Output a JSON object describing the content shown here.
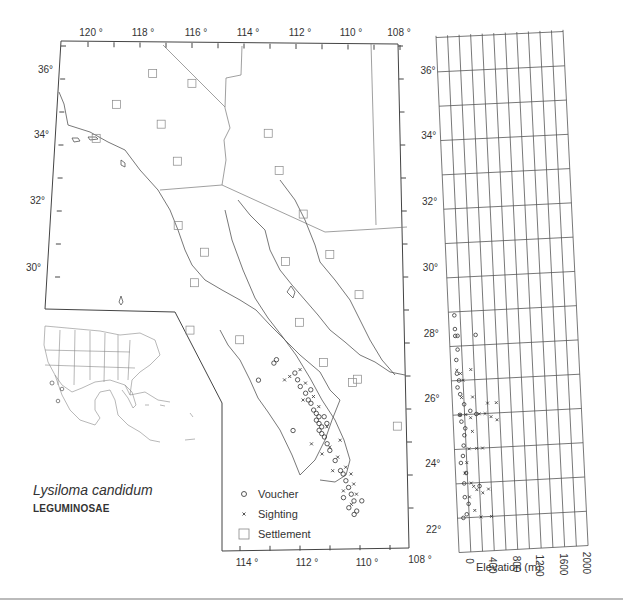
{
  "map": {
    "title_species": "Lysiloma candidum",
    "title_family": "LEGUMINOSAE",
    "top_longitude_labels": [
      "120 °",
      "118 °",
      "116 °",
      "114 °",
      "112 °",
      "110 °",
      "108 °"
    ],
    "bottom_longitude_labels": [
      "114 °",
      "112 °",
      "110 °",
      "108 °"
    ],
    "left_latitude_labels": [
      "36°",
      "34°",
      "32°",
      "30°"
    ],
    "right_latitude_labels": [
      "36°",
      "34°",
      "32°",
      "30°",
      "28°",
      "26°",
      "24°",
      "22°"
    ],
    "legend": [
      {
        "symbol": "circle",
        "label": "Voucher"
      },
      {
        "symbol": "cross",
        "label": "Sighting"
      },
      {
        "symbol": "square",
        "label": "Settlement"
      }
    ],
    "settlements": [
      [
        117.5,
        36.1
      ],
      [
        116.0,
        35.8
      ],
      [
        118.9,
        35.2
      ],
      [
        117.2,
        34.6
      ],
      [
        119.7,
        34.2
      ],
      [
        113.1,
        34.3
      ],
      [
        116.6,
        33.5
      ],
      [
        112.7,
        33.2
      ],
      [
        111.8,
        31.9
      ],
      [
        116.6,
        31.6
      ],
      [
        115.6,
        30.8
      ],
      [
        112.5,
        30.5
      ],
      [
        110.8,
        30.7
      ],
      [
        116.0,
        29.9
      ],
      [
        109.7,
        29.5
      ],
      [
        116.2,
        28.5
      ],
      [
        112.0,
        28.7
      ],
      [
        114.3,
        28.2
      ],
      [
        109.8,
        27.0
      ],
      [
        111.1,
        27.5
      ],
      [
        108.3,
        25.6
      ],
      [
        110.0,
        26.9
      ]
    ],
    "vouchers": [
      [
        112.9,
        27.6
      ],
      [
        113.0,
        27.5
      ],
      [
        112.2,
        27.2
      ],
      [
        112.1,
        27.0
      ],
      [
        112.0,
        26.8
      ],
      [
        111.8,
        26.6
      ],
      [
        111.7,
        26.4
      ],
      [
        111.6,
        26.3
      ],
      [
        111.5,
        26.1
      ],
      [
        111.4,
        26.0
      ],
      [
        111.3,
        25.9
      ],
      [
        111.4,
        25.8
      ],
      [
        111.3,
        25.7
      ],
      [
        111.2,
        25.6
      ],
      [
        111.3,
        25.5
      ],
      [
        111.2,
        25.4
      ],
      [
        111.1,
        25.3
      ],
      [
        111.0,
        25.1
      ],
      [
        110.9,
        24.9
      ],
      [
        110.7,
        24.6
      ],
      [
        110.5,
        24.3
      ],
      [
        110.4,
        24.2
      ],
      [
        110.3,
        24.0
      ],
      [
        110.2,
        23.8
      ],
      [
        110.1,
        23.6
      ],
      [
        110.0,
        23.4
      ],
      [
        110.2,
        23.2
      ],
      [
        109.9,
        23.1
      ],
      [
        110.0,
        23.0
      ],
      [
        109.7,
        23.4
      ],
      [
        110.4,
        23.5
      ],
      [
        111.1,
        25.9
      ],
      [
        111.0,
        25.7
      ],
      [
        112.3,
        25.5
      ],
      [
        111.6,
        26.7
      ],
      [
        113.6,
        27.0
      ]
    ],
    "sightings": [
      [
        112.6,
        27.0
      ],
      [
        112.4,
        27.1
      ],
      [
        112.0,
        27.3
      ],
      [
        111.8,
        26.9
      ],
      [
        111.5,
        26.5
      ],
      [
        111.3,
        26.2
      ],
      [
        111.0,
        25.6
      ],
      [
        110.9,
        25.0
      ],
      [
        110.6,
        24.7
      ],
      [
        110.3,
        24.4
      ],
      [
        110.1,
        24.2
      ],
      [
        110.0,
        23.9
      ],
      [
        109.9,
        23.6
      ],
      [
        110.1,
        23.3
      ],
      [
        111.6,
        25.1
      ],
      [
        111.2,
        24.8
      ],
      [
        110.8,
        24.3
      ],
      [
        110.4,
        23.7
      ],
      [
        111.9,
        26.4
      ],
      [
        110.5,
        25.2
      ]
    ]
  },
  "elevation_panel": {
    "axis_title": "Elevation (m)",
    "x_tick_labels": [
      "0",
      "400",
      "800",
      "1200",
      "1600",
      "2000"
    ],
    "right_latitude_labels": [
      "36°",
      "34°",
      "32°",
      "30°",
      "28°",
      "26°",
      "24°",
      "22°"
    ]
  },
  "chart_data": {
    "type": "scatter",
    "xlabel": "Elevation (m)",
    "ylabel": "Latitude",
    "xlim": [
      0,
      2000
    ],
    "ylim": [
      22,
      37
    ],
    "grid": true,
    "series": [
      {
        "name": "Voucher",
        "marker": "circle",
        "points": [
          [
            0,
            28.9
          ],
          [
            0,
            28.5
          ],
          [
            0,
            28.3
          ],
          [
            40,
            28.3
          ],
          [
            350,
            28.3
          ],
          [
            30,
            27.9
          ],
          [
            0,
            27.6
          ],
          [
            0,
            27.2
          ],
          [
            30,
            27.0
          ],
          [
            0,
            26.8
          ],
          [
            40,
            26.6
          ],
          [
            100,
            26.3
          ],
          [
            20,
            26.0
          ],
          [
            200,
            26.1
          ],
          [
            300,
            26.0
          ],
          [
            40,
            25.8
          ],
          [
            100,
            25.6
          ],
          [
            80,
            25.4
          ],
          [
            60,
            25.1
          ],
          [
            40,
            24.8
          ],
          [
            0,
            24.6
          ],
          [
            80,
            24.3
          ],
          [
            40,
            24.0
          ],
          [
            300,
            23.9
          ],
          [
            40,
            23.6
          ],
          [
            100,
            23.4
          ],
          [
            60,
            23.1
          ],
          [
            0,
            23.0
          ]
        ]
      },
      {
        "name": "Sighting",
        "marker": "cross",
        "points": [
          [
            0,
            27.3
          ],
          [
            60,
            27.2
          ],
          [
            100,
            27.0
          ],
          [
            240,
            27.3
          ],
          [
            60,
            26.5
          ],
          [
            250,
            26.5
          ],
          [
            500,
            26.3
          ],
          [
            650,
            26.3
          ],
          [
            20,
            26.0
          ],
          [
            120,
            26.0
          ],
          [
            200,
            25.9
          ],
          [
            350,
            26.0
          ],
          [
            450,
            26.0
          ],
          [
            550,
            25.9
          ],
          [
            650,
            25.8
          ],
          [
            220,
            25.5
          ],
          [
            150,
            25.0
          ],
          [
            280,
            25.0
          ],
          [
            380,
            25.0
          ],
          [
            100,
            24.6
          ],
          [
            60,
            24.3
          ],
          [
            160,
            24.0
          ],
          [
            200,
            23.9
          ],
          [
            250,
            23.8
          ],
          [
            350,
            23.7
          ],
          [
            450,
            23.8
          ],
          [
            120,
            23.6
          ],
          [
            200,
            23.2
          ],
          [
            300,
            23.0
          ],
          [
            480,
            23.0
          ]
        ]
      }
    ]
  }
}
